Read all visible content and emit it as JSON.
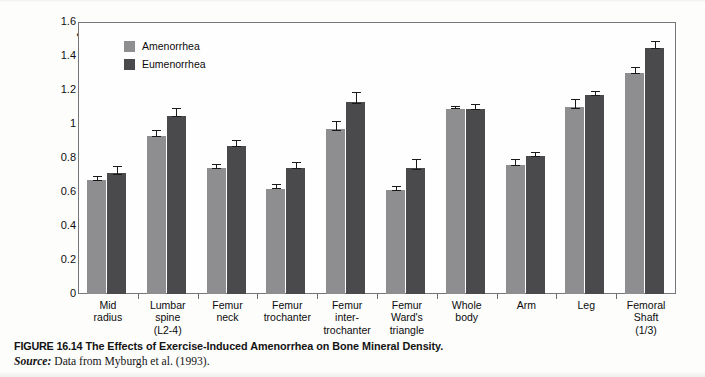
{
  "figure": {
    "caption_figure_number": "FIGURE 16.14",
    "caption_title": "The Effects of Exercise-Induced Amenorrhea on Bone Mineral Density.",
    "source_word": "Source:",
    "source_text": "Data from Myburgh et al. (1993)."
  },
  "colors": {
    "series_amenorrhea": "#8e8e90",
    "series_eumenorrhea": "#4a4a4c",
    "axis": "#76767a",
    "error_bar": "#1a1a1a",
    "plot_background": "#fefefe"
  },
  "chart_data": {
    "type": "bar",
    "title": "",
    "xlabel": "",
    "ylabel": "Bone mineral density (g·cm−2)",
    "ylabel_main": "Bone mineral density (g",
    "ylabel_mid": "cm",
    "ylabel_sup": "−2",
    "ylabel_tail": ")",
    "ylim": [
      0,
      1.6
    ],
    "yticks": [
      "0",
      "0.2",
      "0.4",
      "0.6",
      "0.8",
      "1",
      "1.2",
      "1.4",
      "1.6"
    ],
    "ytick_values": [
      0,
      0.2,
      0.4,
      0.6,
      0.8,
      1.0,
      1.2,
      1.4,
      1.6
    ],
    "grid": false,
    "legend_position": "top-left inside plot",
    "categories": [
      "Mid radius",
      "Lumbar spine (L2-4)",
      "Femur neck",
      "Femur trochanter",
      "Femur inter-trochanter",
      "Femur Ward's triangle",
      "Whole body",
      "Arm",
      "Leg",
      "Femoral Shaft (1/3)"
    ],
    "category_label_lines": [
      [
        "Mid",
        "radius"
      ],
      [
        "Lumbar",
        "spine",
        "(L2-4)"
      ],
      [
        "Femur",
        "neck"
      ],
      [
        "Femur",
        "trochanter"
      ],
      [
        "Femur",
        "inter-",
        "trochanter"
      ],
      [
        "Femur",
        "Ward's",
        "triangle"
      ],
      [
        "Whole",
        "body"
      ],
      [
        "Arm"
      ],
      [
        "Leg"
      ],
      [
        "Femoral",
        "Shaft",
        "(1/3)"
      ]
    ],
    "series": [
      {
        "name": "Amenorrhea",
        "color": "#8e8e90",
        "values": [
          0.67,
          0.93,
          0.74,
          0.62,
          0.97,
          0.61,
          1.09,
          0.76,
          1.1,
          1.3
        ],
        "errors": [
          0.02,
          0.03,
          0.02,
          0.02,
          0.04,
          0.02,
          0.01,
          0.03,
          0.04,
          0.03
        ]
      },
      {
        "name": "Eumenorrhea",
        "color": "#4a4a4c",
        "values": [
          0.71,
          1.05,
          0.87,
          0.74,
          1.13,
          0.74,
          1.09,
          0.81,
          1.17,
          1.45
        ],
        "errors": [
          0.04,
          0.04,
          0.03,
          0.03,
          0.05,
          0.05,
          0.02,
          0.02,
          0.02,
          0.03
        ]
      }
    ]
  }
}
